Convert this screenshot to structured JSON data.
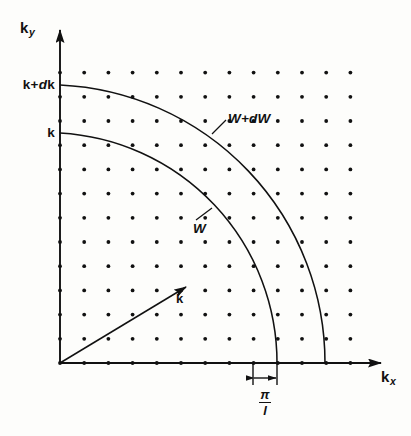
{
  "figure": {
    "background_color": "#fdfdfb",
    "ink_color": "#111111"
  },
  "axes": {
    "x_label_main": "k",
    "x_label_sub": "x",
    "y_label_main": "k",
    "y_label_sub": "y",
    "origin": {
      "x": 60,
      "y": 363
    }
  },
  "tick_labels": [
    {
      "id": "k-plus-dk",
      "text_main": "k+",
      "text_italic": "d",
      "text_tail": "k",
      "value": "k+dk",
      "y": 85
    },
    {
      "id": "k",
      "text_main": "k",
      "text_italic": "",
      "text_tail": "",
      "value": "k",
      "y": 133
    }
  ],
  "curves": [
    {
      "id": "outer-arc",
      "label": "W+dW",
      "label_main": "W+",
      "label_italic": "d",
      "label_tail": "W",
      "radius": 278
    },
    {
      "id": "inner-arc",
      "label": "W",
      "label_main": "W",
      "label_italic": "",
      "label_tail": "",
      "radius": 230
    }
  ],
  "vector": {
    "label": "k",
    "from": {
      "x": 60,
      "y": 363
    },
    "to": {
      "x": 186,
      "y": 287
    }
  },
  "dimension": {
    "label": "pi/l",
    "numerator": "π",
    "denominator": "l",
    "from_x": 253,
    "to_x": 277,
    "value_description": "one lattice spacing in k-space"
  },
  "lattice": {
    "columns": 13,
    "rows": 13,
    "spacing": 24.2,
    "dot_color": "#111111",
    "dot_radius": 1.9,
    "start_x": 60,
    "start_y": 363
  }
}
